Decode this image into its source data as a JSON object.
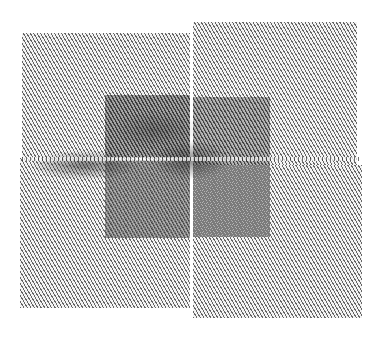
{
  "image": {
    "description": "Line-hatched abstract artwork: four diagonally hatched grey panels in a 2x2 arrangement with a darker central square and dark smudged streaks along the horizontal seam",
    "style": "diagonal hatching",
    "colors": {
      "background": "#ffffff",
      "hatch_light": "#5a5a5a",
      "hatch_dark": "#2a2a2a",
      "gap": "#f2f2f2"
    },
    "regions": [
      {
        "name": "top-left-panel",
        "x": 22,
        "y": 33,
        "w": 168,
        "h": 125
      },
      {
        "name": "top-right-panel",
        "x": 193,
        "y": 22,
        "w": 164,
        "h": 143
      },
      {
        "name": "bottom-left-panel",
        "x": 20,
        "y": 158,
        "w": 170,
        "h": 150
      },
      {
        "name": "bottom-right-panel",
        "x": 193,
        "y": 165,
        "w": 169,
        "h": 153
      },
      {
        "name": "central-dark-square",
        "x": 105,
        "y": 95,
        "w": 165,
        "h": 143
      }
    ]
  }
}
